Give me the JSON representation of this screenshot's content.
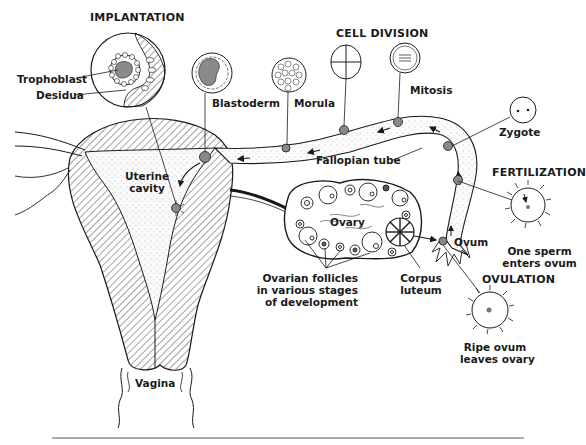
{
  "diagram": {
    "headings": {
      "implantation": "IMPLANTATION",
      "cell_division": "CELL DIVISION",
      "fertilization": "FERTILIZATION",
      "ovulation": "OVULATION"
    },
    "labels": {
      "trophoblast": "Trophoblast",
      "desidua": "Desidua",
      "blastoderm": "Blastoderm",
      "morula": "Morula",
      "mitosis": "Mitosis",
      "zygote": "Zygote",
      "fallopian_tube": "Fallopian tube",
      "uterine_cavity_1": "Uterine",
      "uterine_cavity_2": "cavity",
      "ovary": "Ovary",
      "ovum": "Ovum",
      "corpus_luteum_1": "Corpus",
      "corpus_luteum_2": "luteum",
      "ovarian_follicles_1": "Ovarian follicles",
      "ovarian_follicles_2": "in various stages",
      "ovarian_follicles_3": "of development",
      "fertilization_caption_1": "One sperm",
      "fertilization_caption_2": "enters ovum",
      "ovulation_caption_1": "Ripe ovum",
      "ovulation_caption_2": "leaves ovary",
      "vagina": "Vagina"
    },
    "colors": {
      "ink": "#1a1a1a",
      "fill_gray": "#8a8a8a",
      "background": "#ffffff"
    }
  }
}
